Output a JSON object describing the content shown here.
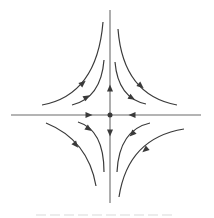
{
  "diagram": {
    "title": "Saddle point phase portrait",
    "colors": {
      "stroke": "#3a3a3a",
      "axis": "#6a6a6a",
      "background": "#ffffff"
    },
    "axes": {
      "horizontal": {
        "x1": 11,
        "y1": 115,
        "x2": 201,
        "y2": 115
      },
      "vertical": {
        "x1": 110,
        "y1": 10,
        "x2": 110,
        "y2": 203
      }
    },
    "equilibrium": {
      "cx": 110,
      "cy": 115,
      "r": 2.5,
      "type": "saddle"
    },
    "axis_arrows": [
      {
        "name": "arrow-up-on-vertical-axis",
        "x": 110,
        "y": 88,
        "angle": -90
      },
      {
        "name": "arrow-right-on-horizontal-axis",
        "x": 89,
        "y": 115,
        "angle": 0
      },
      {
        "name": "arrow-left-on-horizontal-axis",
        "x": 132,
        "y": 115,
        "angle": 180
      },
      {
        "name": "arrow-down-on-vertical-axis",
        "x": 110,
        "y": 133,
        "angle": 90
      }
    ],
    "trajectories": [
      {
        "name": "trajectory-top-left-outer",
        "d": "M 42 105 Q 97 95 103 22",
        "arrow": {
          "x": 83,
          "y": 83,
          "angle": -40
        }
      },
      {
        "name": "trajectory-top-left-inner",
        "d": "M 72 105 Q 101 98 104 60",
        "arrow": {
          "x": 87,
          "y": 97,
          "angle": -30
        }
      },
      {
        "name": "trajectory-top-right-outer",
        "d": "M 118 29 Q 123 95 177 105",
        "arrow": {
          "x": 141,
          "y": 86,
          "angle": 40
        }
      },
      {
        "name": "trajectory-top-right-inner",
        "d": "M 115 62 Q 118 98 146 104",
        "arrow": {
          "x": 132,
          "y": 98,
          "angle": 30
        }
      },
      {
        "name": "trajectory-bottom-left-outer",
        "d": "M 46 123 Q 88 140 96 186",
        "arrow": {
          "x": 76,
          "y": 145,
          "angle": 50
        }
      },
      {
        "name": "trajectory-bottom-left-inner",
        "d": "M 78 122 Q 104 130 104 172",
        "arrow": {
          "x": 89,
          "y": 129,
          "angle": 35
        }
      },
      {
        "name": "trajectory-bottom-right-inner",
        "d": "M 150 123 Q 119 130 117 172",
        "arrow": {
          "x": 132,
          "y": 134,
          "angle": 135
        }
      },
      {
        "name": "trajectory-bottom-right-outer",
        "d": "M 184 129 Q 128 138 119 197",
        "arrow": {
          "x": 145,
          "y": 150,
          "angle": 140
        }
      }
    ]
  }
}
